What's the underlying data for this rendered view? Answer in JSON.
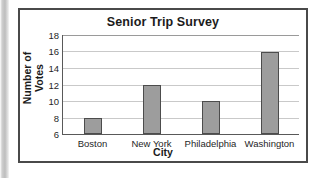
{
  "chart_data": {
    "type": "bar",
    "title": "Senior Trip Survey",
    "xlabel": "City",
    "ylabel": "Number of Votes",
    "categories": [
      "Boston",
      "New York",
      "Philadelphia",
      "Washington"
    ],
    "values": [
      8,
      12,
      10,
      16
    ],
    "ylim": [
      6,
      18
    ],
    "yticks": [
      6,
      8,
      10,
      12,
      14,
      16,
      18
    ],
    "grid": true,
    "legend": false,
    "bar_color": "#9d9d9d",
    "bar_edge_color": "#4c4c4c",
    "axis_color": "#595959",
    "grid_color": "#c9c9c9",
    "text_color": "#1b1b1b",
    "background": "#ffffff"
  }
}
